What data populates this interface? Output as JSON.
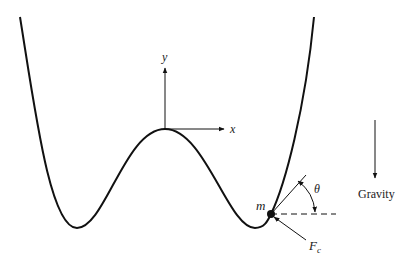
{
  "diagram": {
    "title": "",
    "labels": {
      "y_axis": "y",
      "x_axis": "x",
      "mass": "m",
      "angle": "θ",
      "force_main": "F",
      "force_sub": "c",
      "gravity": "Gravity"
    },
    "colors": {
      "stroke": "#111111",
      "background": "#ffffff"
    }
  }
}
